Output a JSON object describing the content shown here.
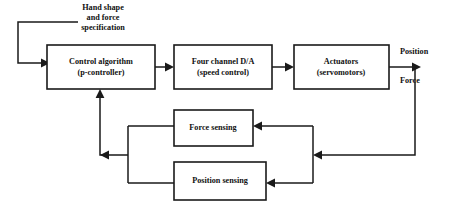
{
  "diagram": {
    "colors": {
      "background": "#ffffff",
      "stroke": "#1a1a1a",
      "text": "#111111"
    },
    "input_label": {
      "line1": "Hand shape",
      "line2": "and force",
      "line3": "specification"
    },
    "blocks": [
      {
        "id": "control-algorithm",
        "line1": "Control algorithm",
        "line2": "(p-controller)"
      },
      {
        "id": "four-channel-da",
        "line1": "Four channel D/A",
        "line2": "(speed control)"
      },
      {
        "id": "actuators",
        "line1": "Actuators",
        "line2": "(servomotors)"
      },
      {
        "id": "force-sensing",
        "line1": "Force sensing",
        "line2": ""
      },
      {
        "id": "position-sensing",
        "line1": "Position sensing",
        "line2": ""
      }
    ],
    "outputs": [
      {
        "id": "position-output",
        "label": "Position"
      },
      {
        "id": "force-output",
        "label": "Force"
      }
    ]
  }
}
